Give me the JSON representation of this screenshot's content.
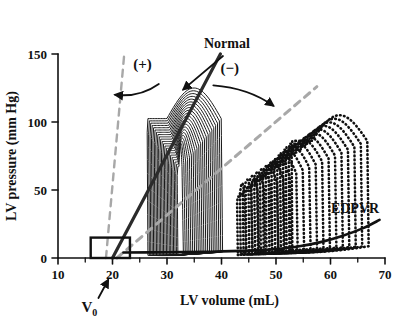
{
  "chart_data": {
    "type": "line",
    "title": "",
    "xlabel": "LV volume (mL)",
    "ylabel": "LV pressure  (mm Hg)",
    "xlim": [
      10,
      70
    ],
    "ylim": [
      0,
      150
    ],
    "xticks": [
      10,
      20,
      30,
      40,
      50,
      60,
      70
    ],
    "xtick_labels": [
      "10",
      "20",
      "30",
      "40",
      "50",
      "60",
      "70"
    ],
    "yticks": [
      0,
      50,
      100,
      150
    ],
    "ytick_labels": [
      "0",
      "50",
      "100",
      "150"
    ],
    "x_minor_ticks": [
      15,
      25,
      35,
      45,
      55,
      65
    ],
    "grid": false,
    "legend": "none",
    "annotations": [
      {
        "name": "normal",
        "text": "Normal",
        "x": 41,
        "y": 150,
        "points_to": {
          "x": 33,
          "y": 124
        }
      },
      {
        "name": "positive-inotropy",
        "text": "(+)",
        "x": 25.5,
        "y": 139,
        "points_to": {
          "x": 20.5,
          "y": 120
        }
      },
      {
        "name": "negative-inotropy",
        "text": "(−)",
        "x": 41.5,
        "y": 136,
        "points_to": {
          "x": 49.5,
          "y": 112
        }
      },
      {
        "name": "edpvr",
        "text": "EDPVR",
        "x": 64.5,
        "y": 33
      },
      {
        "name": "v-zero",
        "text": "V",
        "subscript": "0",
        "x": 16.5,
        "y": -26
      }
    ],
    "series": [
      {
        "name": "ESPVR Normal",
        "style": "solid-dark",
        "color": "#2b2b2b",
        "width": 3.2,
        "points": [
          [
            20.0,
            0
          ],
          [
            39.8,
            150
          ]
        ]
      },
      {
        "name": "ESPVR increased contractility",
        "style": "dashed-gray",
        "color": "#a8a8a8",
        "width": 2.4,
        "points": [
          [
            18.8,
            0
          ],
          [
            22.2,
            152
          ]
        ]
      },
      {
        "name": "ESPVR decreased contractility",
        "style": "dashed-gray",
        "color": "#a8a8a8",
        "width": 3.0,
        "points": [
          [
            20.8,
            0
          ],
          [
            57.5,
            126
          ]
        ]
      },
      {
        "name": "EDPVR",
        "style": "solid-dark-curve",
        "color": "#111111",
        "width": 2.6,
        "points": [
          [
            22,
            4
          ],
          [
            30,
            4.2
          ],
          [
            38,
            4.6
          ],
          [
            45,
            5.4
          ],
          [
            50,
            6.6
          ],
          [
            54,
            8.4
          ],
          [
            58,
            11.5
          ],
          [
            62,
            16
          ],
          [
            66,
            22
          ],
          [
            69,
            28
          ]
        ]
      }
    ],
    "loop_families": [
      {
        "name": "normal-loops",
        "style": "solid",
        "color": "#1a1a1a",
        "count": 22,
        "description": "Solid pressure-volume loops, peak systolic pressure ~125 mmHg, end-systolic volumes 25-38 mL, end-diastolic volumes 33-40 mL",
        "edv_start": 40.2,
        "edv_end": 33.0,
        "esv_start": 26.5,
        "esv_end": 32.0,
        "peak_start": 125,
        "peak_end": 82
      },
      {
        "name": "reduced-contractility-loops",
        "style": "dotted",
        "color": "#111111",
        "count": 20,
        "description": "Dotted pressure-volume loops, peak systolic pressure ~105 mmHg, shifted rightward, end-diastolic volumes 44-67 mL",
        "edv_start": 67.0,
        "edv_end": 44.5,
        "esv_start": 53.0,
        "esv_end": 43.0,
        "peak_start": 105,
        "peak_end": 55
      }
    ],
    "v0_box": {
      "x0": 16.0,
      "x1": 23.2,
      "y0": 0,
      "y1": 15,
      "label": "V0"
    }
  },
  "colors": {
    "axis": "#111111",
    "normal_line": "#2b2b2b",
    "dashed_gray": "#a8a8a8",
    "loop_solid": "#1a1a1a",
    "loop_dotted": "#111111",
    "background": "#ffffff"
  }
}
